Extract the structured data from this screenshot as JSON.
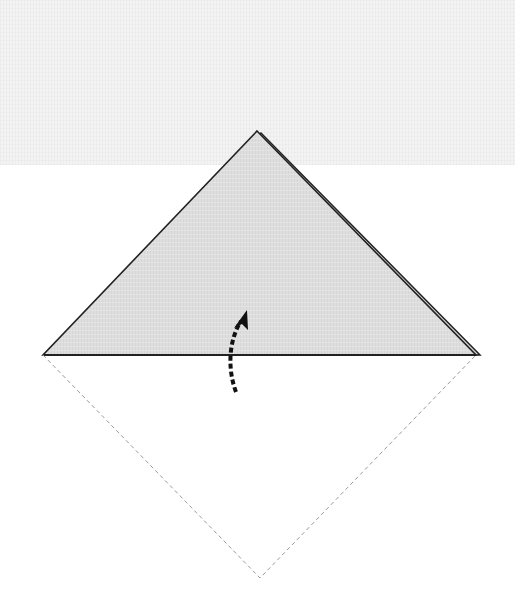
{
  "diagram": {
    "type": "origami-fold-step",
    "colors": {
      "paper_fill": "#dedede",
      "outline": "#222222",
      "dashed_outline": "#9a9a9a",
      "arrow": "#111111",
      "top_band": "#f3f3f3"
    },
    "folded_triangle": {
      "apex": [
        257,
        131
      ],
      "left": [
        43,
        355
      ],
      "right": [
        476,
        355
      ],
      "back_layer_offset": [
        4,
        2
      ]
    },
    "unfolded_outline": {
      "left": [
        43,
        355
      ],
      "bottom": [
        260,
        578
      ],
      "right": [
        476,
        355
      ],
      "style": "dashed"
    },
    "fold_arrow": {
      "start": [
        236,
        392
      ],
      "end": [
        246,
        311
      ],
      "style": "dashed",
      "direction": "up"
    }
  }
}
